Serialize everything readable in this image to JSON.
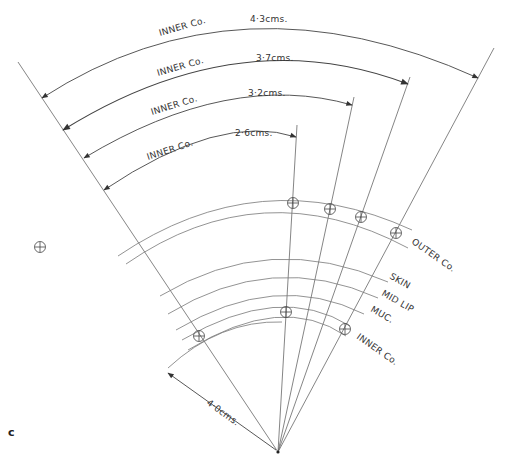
{
  "figure": {
    "panel_label": "c",
    "dimensions": [
      {
        "label": "INNER  Co.",
        "value": "4·3cms."
      },
      {
        "label": "INNER  Co.",
        "value": "3·7cms."
      },
      {
        "label": "INNER  Co.",
        "value": "3·2cms."
      },
      {
        "label": "INNER  Co.",
        "value": "2·6cms."
      }
    ],
    "radius_label": "4·0cms.",
    "arc_labels": {
      "outer": "OUTER Co.",
      "skin": "SKIN",
      "mid_lip": "MID LIP",
      "muc": "MUC.",
      "inner": "INNER Co."
    },
    "colors": {
      "line": "#555555",
      "text": "#333333",
      "background": "#ffffff"
    }
  }
}
